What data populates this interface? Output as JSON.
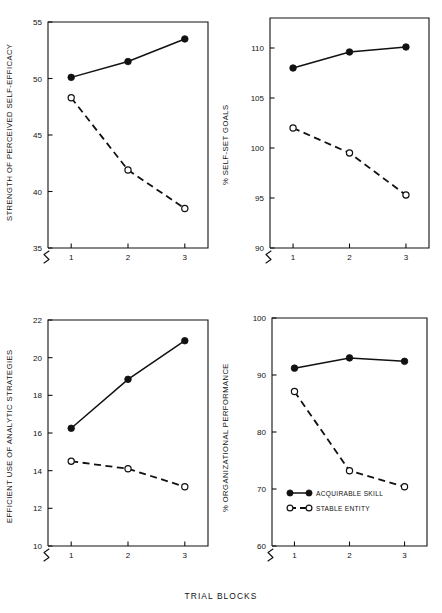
{
  "figure": {
    "xlabel": "TRIAL BLOCKS",
    "categories": [
      "1",
      "2",
      "3"
    ],
    "legend": [
      {
        "label": "ACQUIRABLE SKILL",
        "marker": "filled-circle",
        "line": "solid"
      },
      {
        "label": "STABLE ENTITY",
        "marker": "open-circle",
        "line": "dashed"
      }
    ],
    "colors": {
      "ink": "#111111",
      "background": "#ffffff"
    }
  },
  "chart_data": [
    {
      "type": "line",
      "panel": "top-left",
      "title": "",
      "ylabel": "STRENGTH OF PERCEIVED SELF-EFFICACY",
      "xlabel": "TRIAL BLOCKS",
      "x": [
        1,
        2,
        3
      ],
      "categories": [
        "1",
        "2",
        "3"
      ],
      "yticks": [
        35,
        40,
        45,
        50,
        55
      ],
      "ylim": [
        35,
        55
      ],
      "axis_break": true,
      "grid": false,
      "legend_position": "none",
      "series": [
        {
          "name": "ACQUIRABLE SKILL",
          "marker": "filled-circle",
          "line": "solid",
          "values": [
            50.1,
            51.5,
            53.5
          ]
        },
        {
          "name": "STABLE ENTITY",
          "marker": "open-circle",
          "line": "dashed",
          "values": [
            48.3,
            41.9,
            38.5
          ]
        }
      ]
    },
    {
      "type": "line",
      "panel": "top-right",
      "title": "",
      "ylabel": "% SELF-SET GOALS",
      "xlabel": "TRIAL BLOCKS",
      "x": [
        1,
        2,
        3
      ],
      "categories": [
        "1",
        "2",
        "3"
      ],
      "yticks": [
        90,
        95,
        100,
        105,
        110
      ],
      "ylim": [
        90,
        113
      ],
      "axis_break": true,
      "grid": false,
      "legend_position": "none",
      "series": [
        {
          "name": "ACQUIRABLE SKILL",
          "marker": "filled-circle",
          "line": "solid",
          "values": [
            108.0,
            109.6,
            110.1
          ]
        },
        {
          "name": "STABLE ENTITY",
          "marker": "open-circle",
          "line": "dashed",
          "values": [
            102.0,
            99.5,
            95.3
          ]
        }
      ]
    },
    {
      "type": "line",
      "panel": "bottom-left",
      "title": "",
      "ylabel": "EFFICIENT USE OF ANALYTIC STRATEGIES",
      "xlabel": "TRIAL BLOCKS",
      "x": [
        1,
        2,
        3
      ],
      "categories": [
        "1",
        "2",
        "3"
      ],
      "yticks": [
        10,
        12,
        14,
        16,
        18,
        20,
        22
      ],
      "ylim": [
        10,
        22
      ],
      "axis_break": true,
      "grid": false,
      "legend_position": "none",
      "series": [
        {
          "name": "ACQUIRABLE SKILL",
          "marker": "filled-circle",
          "line": "solid",
          "values": [
            16.25,
            18.85,
            20.9
          ]
        },
        {
          "name": "STABLE ENTITY",
          "marker": "open-circle",
          "line": "dashed",
          "values": [
            14.5,
            14.1,
            13.15
          ]
        }
      ]
    },
    {
      "type": "line",
      "panel": "bottom-right",
      "title": "",
      "ylabel": "% ORGANIZATIONAL PERFORMANCE",
      "xlabel": "TRIAL BLOCKS",
      "x": [
        1,
        2,
        3
      ],
      "categories": [
        "1",
        "2",
        "3"
      ],
      "yticks": [
        60,
        70,
        80,
        90,
        100
      ],
      "ylim": [
        60,
        100
      ],
      "axis_break": true,
      "grid": false,
      "legend_position": "inside-bottom-left",
      "series": [
        {
          "name": "ACQUIRABLE SKILL",
          "marker": "filled-circle",
          "line": "solid",
          "values": [
            91.2,
            93.0,
            92.4
          ]
        },
        {
          "name": "STABLE ENTITY",
          "marker": "open-circle",
          "line": "dashed",
          "values": [
            87.1,
            73.2,
            70.4
          ]
        }
      ]
    }
  ]
}
